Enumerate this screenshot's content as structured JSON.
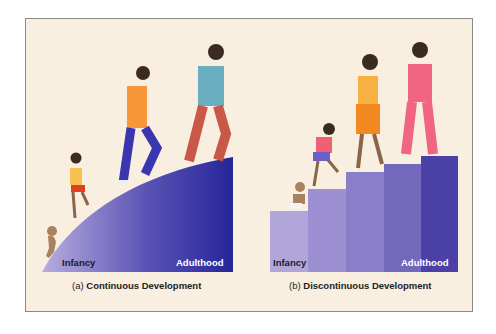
{
  "panels": [
    {
      "id": "a",
      "caption_prefix": "(a)",
      "caption_title": "Continuous Development",
      "start_label": "Infancy",
      "end_label": "Adulthood",
      "shape": "ramp"
    },
    {
      "id": "b",
      "caption_prefix": "(b)",
      "caption_title": "Discontinuous Development",
      "start_label": "Infancy",
      "end_label": "Adulthood",
      "shape": "stairs",
      "steps": 5
    }
  ],
  "colors": {
    "background": "#f8efe0",
    "ramp_light": "#b3a8dc",
    "ramp_dark": "#2a2a9a",
    "step_colors": [
      "#b0a6da",
      "#9c90d2",
      "#8a7ec8",
      "#7468bc",
      "#4a40a6"
    ],
    "label_dark": "#1a1a2a",
    "label_light": "#ffffff"
  }
}
